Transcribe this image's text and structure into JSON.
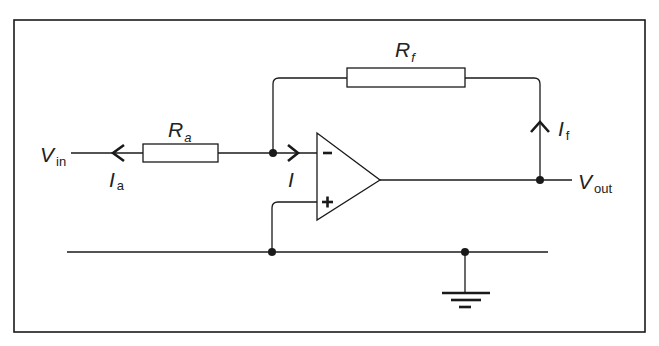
{
  "diagram": {
    "colors": {
      "line": "#1a1a1a",
      "background": "#ffffff"
    },
    "labels": {
      "vin_main": "V",
      "vin_sub": "in",
      "ra_main": "R",
      "ra_sub": "a",
      "rf_main": "R",
      "rf_sub": "f",
      "ia_main": "I",
      "ia_sub": "a",
      "i_main": "I",
      "if_main": "I",
      "if_sub": "f",
      "vout_main": "V",
      "vout_sub": "out",
      "minus": "–",
      "plus": "+"
    },
    "components": [
      {
        "name": "input-resistor",
        "label": "Ra"
      },
      {
        "name": "feedback-resistor",
        "label": "Rf"
      },
      {
        "name": "op-amp",
        "inputs": [
          "-",
          "+"
        ]
      },
      {
        "name": "ground",
        "label": ""
      }
    ],
    "currents": [
      {
        "name": "Ia",
        "direction": "left"
      },
      {
        "name": "I",
        "direction": "right"
      },
      {
        "name": "If",
        "direction": "up"
      }
    ]
  }
}
